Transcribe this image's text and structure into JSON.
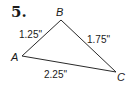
{
  "problem": {
    "number": "5."
  },
  "triangle": {
    "vertices": [
      {
        "name": "A",
        "x": 22,
        "y": 56
      },
      {
        "name": "B",
        "x": 61,
        "y": 20
      },
      {
        "name": "C",
        "x": 116,
        "y": 72
      }
    ],
    "sides": [
      {
        "from": "A",
        "to": "B",
        "label": "1.25\""
      },
      {
        "from": "B",
        "to": "C",
        "label": "1.75\""
      },
      {
        "from": "A",
        "to": "C",
        "label": "2.25\""
      }
    ]
  },
  "colors": {
    "ink": "#1a1a1a",
    "background": "#ffffff"
  }
}
